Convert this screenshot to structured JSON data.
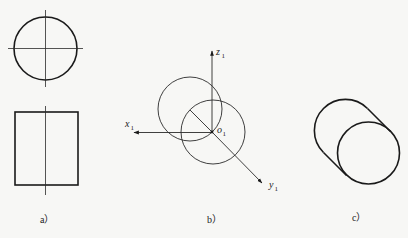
{
  "figure": {
    "panels": [
      {
        "id": "a",
        "caption": "a）",
        "description": "Orthographic views of a cylinder: top view circle with center lines, front view rectangle with vertical center line"
      },
      {
        "id": "b",
        "caption": "b）",
        "description": "Coordinate system o1-x1y1z1 with two offset circles representing cylinder end faces",
        "axes": {
          "x": {
            "label": "x",
            "subscript": "1"
          },
          "y": {
            "label": "y",
            "subscript": "1"
          },
          "z": {
            "label": "z",
            "subscript": "1"
          },
          "origin": {
            "label": "o",
            "subscript": "1"
          }
        }
      },
      {
        "id": "c",
        "caption": "c）",
        "description": "Oblique pictorial of cylinder: two circles connected by tangent lines"
      }
    ]
  },
  "colors": {
    "background": "#f7f7f5",
    "line": "#1a1a1a"
  }
}
